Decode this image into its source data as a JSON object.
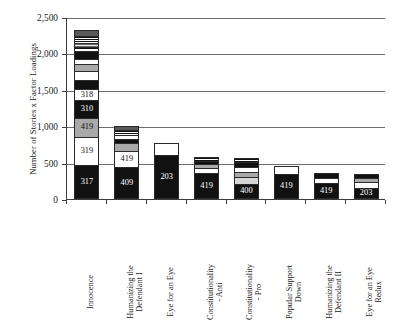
{
  "chart_data": {
    "type": "bar",
    "subtype": "stacked-bar",
    "title": "",
    "xlabel": "",
    "ylabel": "Number of Stories x Factor Loadings",
    "ylim": [
      0,
      2500
    ],
    "ytick_values": [
      0,
      500,
      1000,
      1500,
      2000,
      2500
    ],
    "ytick_labels": [
      "0",
      "500",
      "1,000",
      "1,500",
      "2,000",
      "2,500"
    ],
    "grid": "horizontal",
    "legend": "none",
    "categories": [
      "Innocence",
      "Humanizing the Defendant I",
      "Eye for an Eye",
      "Constitutionality - Anti",
      "Constitutionality - Pro",
      "Popular Support Down",
      "Humanizing the Defendant II",
      "Eye for an Eye Redux"
    ],
    "totals": [
      2320,
      1000,
      770,
      580,
      570,
      460,
      355,
      345
    ],
    "bars": [
      {
        "category": "Innocence",
        "total": 2320,
        "segments": [
          {
            "value": 450,
            "label": "317",
            "fill": "black",
            "label_color": "light"
          },
          {
            "value": 390,
            "label": "319",
            "fill": "white",
            "label_color": "dark"
          },
          {
            "value": 265,
            "label": "419",
            "fill": "gray",
            "label_color": "dark"
          },
          {
            "value": 245,
            "label": "310",
            "fill": "black",
            "label_color": "light"
          },
          {
            "value": 150,
            "label": "318",
            "fill": "white",
            "label_color": "dark"
          },
          {
            "value": 125,
            "label": "",
            "fill": "black",
            "label_color": "light"
          },
          {
            "value": 130,
            "label": "",
            "fill": "white",
            "label_color": "dark"
          },
          {
            "value": 95,
            "label": "",
            "fill": "gray",
            "label_color": "dark"
          },
          {
            "value": 70,
            "label": "",
            "fill": "white",
            "label_color": "dark"
          },
          {
            "value": 110,
            "label": "",
            "fill": "black",
            "label_color": "light"
          },
          {
            "value": 60,
            "label": "",
            "fill": "hstripe-wide",
            "label_color": "dark"
          },
          {
            "value": 55,
            "label": "",
            "fill": "gstripe",
            "label_color": "dark"
          },
          {
            "value": 90,
            "label": "",
            "fill": "hstripe",
            "label_color": "dark"
          },
          {
            "value": 85,
            "label": "",
            "fill": "dgray",
            "label_color": "light"
          }
        ]
      },
      {
        "category": "Humanizing the Defendant I",
        "total": 1000,
        "segments": [
          {
            "value": 430,
            "label": "409",
            "fill": "black",
            "label_color": "light"
          },
          {
            "value": 225,
            "label": "419",
            "fill": "white",
            "label_color": "dark"
          },
          {
            "value": 110,
            "label": "",
            "fill": "gray",
            "label_color": "dark"
          },
          {
            "value": 55,
            "label": "",
            "fill": "black",
            "label_color": "light"
          },
          {
            "value": 60,
            "label": "",
            "fill": "white",
            "label_color": "dark"
          },
          {
            "value": 65,
            "label": "",
            "fill": "hstripe",
            "label_color": "dark"
          },
          {
            "value": 55,
            "label": "",
            "fill": "dgray",
            "label_color": "light"
          }
        ]
      },
      {
        "category": "Eye for an Eye",
        "total": 770,
        "segments": [
          {
            "value": 595,
            "label": "203",
            "fill": "black",
            "label_color": "light"
          },
          {
            "value": 175,
            "label": "",
            "fill": "white",
            "label_color": "dark"
          }
        ]
      },
      {
        "category": "Constitutionality - Anti",
        "total": 580,
        "segments": [
          {
            "value": 345,
            "label": "419",
            "fill": "black",
            "label_color": "light"
          },
          {
            "value": 70,
            "label": "",
            "fill": "white",
            "label_color": "dark"
          },
          {
            "value": 55,
            "label": "",
            "fill": "gray",
            "label_color": "dark"
          },
          {
            "value": 50,
            "label": "",
            "fill": "black",
            "label_color": "light"
          },
          {
            "value": 60,
            "label": "",
            "fill": "hstripe",
            "label_color": "dark"
          }
        ]
      },
      {
        "category": "Constitutionality - Pro",
        "total": 570,
        "segments": [
          {
            "value": 190,
            "label": "400",
            "fill": "black",
            "label_color": "light"
          },
          {
            "value": 95,
            "label": "",
            "fill": "lgray",
            "label_color": "dark"
          },
          {
            "value": 75,
            "label": "",
            "fill": "gray",
            "label_color": "dark"
          },
          {
            "value": 70,
            "label": "",
            "fill": "white",
            "label_color": "dark"
          },
          {
            "value": 70,
            "label": "",
            "fill": "black",
            "label_color": "light"
          },
          {
            "value": 70,
            "label": "",
            "fill": "hstripe",
            "label_color": "dark"
          }
        ]
      },
      {
        "category": "Popular Support Down",
        "total": 460,
        "segments": [
          {
            "value": 340,
            "label": "419",
            "fill": "black",
            "label_color": "light"
          },
          {
            "value": 120,
            "label": "",
            "fill": "white",
            "label_color": "dark"
          }
        ]
      },
      {
        "category": "Humanizing the Defendant II",
        "total": 355,
        "segments": [
          {
            "value": 215,
            "label": "419",
            "fill": "black",
            "label_color": "light"
          },
          {
            "value": 65,
            "label": "",
            "fill": "white",
            "label_color": "dark"
          },
          {
            "value": 75,
            "label": "",
            "fill": "black",
            "label_color": "light"
          }
        ]
      },
      {
        "category": "Eye for an Eye Redux",
        "total": 345,
        "segments": [
          {
            "value": 130,
            "label": "203",
            "fill": "black",
            "label_color": "light"
          },
          {
            "value": 100,
            "label": "",
            "fill": "white",
            "label_color": "dark"
          },
          {
            "value": 50,
            "label": "",
            "fill": "gray",
            "label_color": "dark"
          },
          {
            "value": 65,
            "label": "",
            "fill": "black",
            "label_color": "light"
          }
        ]
      }
    ]
  },
  "axes": {
    "y_title": "Number of Stories x Factor Loadings"
  },
  "xlabels": [
    [
      "Innocence"
    ],
    [
      "Humanizing the",
      "Defendant I"
    ],
    [
      "Eye for an Eye"
    ],
    [
      "Constitutionality",
      "- Anti"
    ],
    [
      "Constitutionality",
      "- Pro"
    ],
    [
      "Popular Support",
      "Down"
    ],
    [
      "Humanizing the",
      "Defendant II"
    ],
    [
      "Eye for an Eye",
      "Redux"
    ]
  ]
}
